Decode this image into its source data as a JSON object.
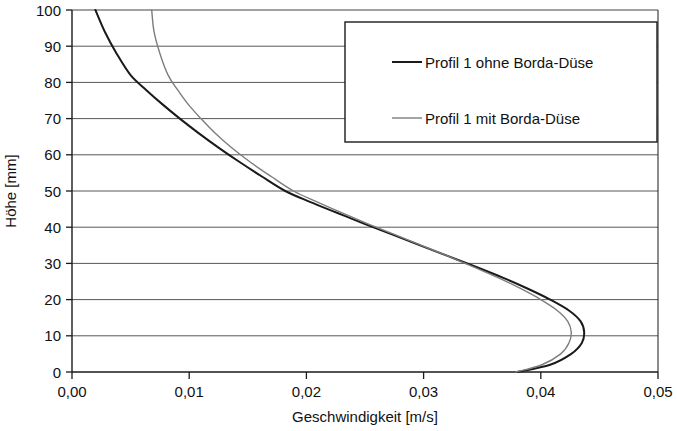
{
  "chart_data": {
    "type": "line",
    "title": "",
    "xlabel": "Geschwindigkeit [m/s]",
    "ylabel": "Höhe [mm]",
    "xlim": [
      0.0,
      0.05
    ],
    "ylim": [
      0,
      100
    ],
    "xticks": [
      0.0,
      0.01,
      0.02,
      0.03,
      0.04,
      0.05
    ],
    "xtick_labels": [
      "0,00",
      "0,01",
      "0,02",
      "0,03",
      "0,04",
      "0,05"
    ],
    "yticks": [
      0,
      10,
      20,
      30,
      40,
      50,
      60,
      70,
      80,
      90,
      100
    ],
    "ytick_labels": [
      "0",
      "10",
      "20",
      "30",
      "40",
      "50",
      "60",
      "70",
      "80",
      "90",
      "100"
    ],
    "grid": "horizontal",
    "legend_position": "top-right",
    "orientation": "x=velocity, y=height",
    "series": [
      {
        "name": "Profil 1 ohne Borda-Düse",
        "color": "#1a1a1a",
        "linewidth": 2.0,
        "x": [
          0.038,
          0.0408,
          0.0426,
          0.0435,
          0.0437,
          0.0434,
          0.0424,
          0.0408,
          0.0389,
          0.0368,
          0.0345,
          0.0321,
          0.0297,
          0.0273,
          0.0249,
          0.0226,
          0.0203,
          0.0182,
          0.0162,
          0.0143,
          0.0125,
          0.0108,
          0.0092,
          0.0077,
          0.0063,
          0.005,
          0.0038,
          0.0028,
          0.002
        ],
        "y": [
          0,
          2,
          5,
          8,
          11,
          14,
          17,
          20,
          23,
          26,
          29,
          32,
          35,
          38,
          41,
          44,
          47,
          50,
          54,
          58,
          62,
          66,
          70,
          74,
          78,
          82,
          88,
          94,
          100
        ]
      },
      {
        "name": "Profil 1 mit Borda-Düse",
        "color": "#7d7d7d",
        "linewidth": 1.4,
        "x": [
          0.0379,
          0.0401,
          0.0417,
          0.0424,
          0.0426,
          0.0423,
          0.0414,
          0.04,
          0.0383,
          0.0364,
          0.0343,
          0.0321,
          0.0298,
          0.0275,
          0.0252,
          0.023,
          0.0209,
          0.0189,
          0.017,
          0.0152,
          0.0136,
          0.0122,
          0.011,
          0.0099,
          0.009,
          0.0082,
          0.0075,
          0.007,
          0.0068
        ],
        "y": [
          0,
          2,
          5,
          8,
          11,
          14,
          17,
          20,
          23,
          26,
          29,
          32,
          35,
          38,
          41,
          44,
          47,
          50,
          54,
          58,
          62,
          66,
          70,
          74,
          78,
          82,
          88,
          94,
          100
        ]
      }
    ]
  },
  "legend": {
    "entries": [
      {
        "label": "Profil 1 ohne Borda-Düse",
        "color": "#1a1a1a"
      },
      {
        "label": "Profil 1 mit Borda-Düse",
        "color": "#7d7d7d"
      }
    ]
  },
  "axes": {
    "x_title": "Geschwindigkeit [m/s]",
    "y_title": "Höhe [mm]"
  }
}
